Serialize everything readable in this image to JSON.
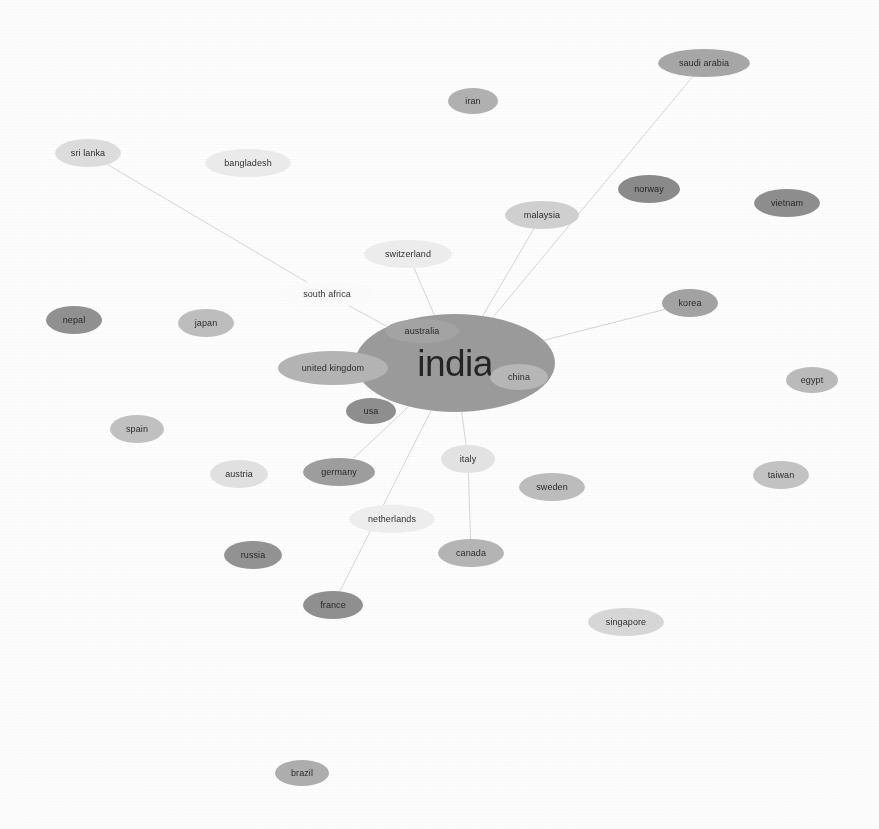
{
  "chart_data": {
    "type": "network-graph",
    "title": "",
    "subtitle": "",
    "xlabel": "",
    "ylabel": "",
    "legend": [],
    "annotations": [],
    "grid": false,
    "background_color": "#fdfdfd",
    "edge_color": "#c9c9c9",
    "node_palette": {
      "dark": "#8c8c8c",
      "medium": "#a8a8a8",
      "light": "#c9c9c9",
      "very_light": "#e4e4e4",
      "faint": "#f4f4f4",
      "hub": "#9a9a9a",
      "text": "#1b1b1b"
    },
    "canvas": {
      "width": 879,
      "height": 829
    },
    "nodes": [
      {
        "id": "india",
        "label": "india",
        "x": 455,
        "y": 363,
        "rx": 100,
        "ry": 49,
        "font_size": 37,
        "fill": "#9a9a9a",
        "shade": "hub"
      },
      {
        "id": "australia",
        "label": "australia",
        "x": 422,
        "y": 331,
        "rx": 37,
        "ry": 12,
        "font_size": 9,
        "fill": "#a3a3a3",
        "shade": "medium"
      },
      {
        "id": "china",
        "label": "china",
        "x": 519,
        "y": 377,
        "rx": 29,
        "ry": 13,
        "font_size": 9,
        "fill": "#b6b6b6",
        "shade": "light"
      },
      {
        "id": "united-kingdom",
        "label": "united kingdom",
        "x": 333,
        "y": 368,
        "rx": 55,
        "ry": 17,
        "font_size": 9,
        "fill": "#b3b3b3",
        "shade": "light"
      },
      {
        "id": "usa",
        "label": "usa",
        "x": 371,
        "y": 411,
        "rx": 25,
        "ry": 13,
        "font_size": 9,
        "fill": "#8e8e8e",
        "shade": "dark"
      },
      {
        "id": "south-africa",
        "label": "south africa",
        "x": 327,
        "y": 294,
        "rx": 47,
        "ry": 13,
        "font_size": 9,
        "fill": "#fafafa",
        "shade": "faint"
      },
      {
        "id": "switzerland",
        "label": "switzerland",
        "x": 408,
        "y": 254,
        "rx": 44,
        "ry": 14,
        "font_size": 9,
        "fill": "#ececec",
        "shade": "faint"
      },
      {
        "id": "japan",
        "label": "japan",
        "x": 206,
        "y": 323,
        "rx": 28,
        "ry": 14,
        "font_size": 9,
        "fill": "#bdbdbd",
        "shade": "light"
      },
      {
        "id": "nepal",
        "label": "nepal",
        "x": 74,
        "y": 320,
        "rx": 28,
        "ry": 14,
        "font_size": 9,
        "fill": "#909090",
        "shade": "dark"
      },
      {
        "id": "sri-lanka",
        "label": "sri lanka",
        "x": 88,
        "y": 153,
        "rx": 33,
        "ry": 14,
        "font_size": 9,
        "fill": "#dcdcdc",
        "shade": "very_light"
      },
      {
        "id": "bangladesh",
        "label": "bangladesh",
        "x": 248,
        "y": 163,
        "rx": 43,
        "ry": 14,
        "font_size": 9,
        "fill": "#eaeaea",
        "shade": "faint"
      },
      {
        "id": "iran",
        "label": "iran",
        "x": 473,
        "y": 101,
        "rx": 25,
        "ry": 13,
        "font_size": 9,
        "fill": "#b0b0b0",
        "shade": "light"
      },
      {
        "id": "saudi-arabia",
        "label": "saudi arabia",
        "x": 704,
        "y": 63,
        "rx": 46,
        "ry": 14,
        "font_size": 9,
        "fill": "#a6a6a6",
        "shade": "medium"
      },
      {
        "id": "norway",
        "label": "norway",
        "x": 649,
        "y": 189,
        "rx": 31,
        "ry": 14,
        "font_size": 9,
        "fill": "#8a8a8a",
        "shade": "dark"
      },
      {
        "id": "malaysia",
        "label": "malaysia",
        "x": 542,
        "y": 215,
        "rx": 37,
        "ry": 14,
        "font_size": 9,
        "fill": "#cfcfcf",
        "shade": "light"
      },
      {
        "id": "vietnam",
        "label": "vietnam",
        "x": 787,
        "y": 203,
        "rx": 33,
        "ry": 14,
        "font_size": 9,
        "fill": "#8d8d8d",
        "shade": "dark"
      },
      {
        "id": "korea",
        "label": "korea",
        "x": 690,
        "y": 303,
        "rx": 28,
        "ry": 14,
        "font_size": 9,
        "fill": "#a2a2a2",
        "shade": "medium"
      },
      {
        "id": "egypt",
        "label": "egypt",
        "x": 812,
        "y": 380,
        "rx": 26,
        "ry": 13,
        "font_size": 9,
        "fill": "#bababa",
        "shade": "light"
      },
      {
        "id": "taiwan",
        "label": "taiwan",
        "x": 781,
        "y": 475,
        "rx": 28,
        "ry": 14,
        "font_size": 9,
        "fill": "#c2c2c2",
        "shade": "light"
      },
      {
        "id": "spain",
        "label": "spain",
        "x": 137,
        "y": 429,
        "rx": 27,
        "ry": 14,
        "font_size": 9,
        "fill": "#c0c0c0",
        "shade": "light"
      },
      {
        "id": "austria",
        "label": "austria",
        "x": 239,
        "y": 474,
        "rx": 29,
        "ry": 14,
        "font_size": 9,
        "fill": "#e0e0e0",
        "shade": "very_light"
      },
      {
        "id": "germany",
        "label": "germany",
        "x": 339,
        "y": 472,
        "rx": 36,
        "ry": 14,
        "font_size": 9,
        "fill": "#9d9d9d",
        "shade": "medium"
      },
      {
        "id": "italy",
        "label": "italy",
        "x": 468,
        "y": 459,
        "rx": 27,
        "ry": 14,
        "font_size": 9,
        "fill": "#e2e2e2",
        "shade": "very_light"
      },
      {
        "id": "sweden",
        "label": "sweden",
        "x": 552,
        "y": 487,
        "rx": 33,
        "ry": 14,
        "font_size": 9,
        "fill": "#bcbcbc",
        "shade": "light"
      },
      {
        "id": "netherlands",
        "label": "netherlands",
        "x": 392,
        "y": 519,
        "rx": 43,
        "ry": 14,
        "font_size": 9,
        "fill": "#ededed",
        "shade": "faint"
      },
      {
        "id": "canada",
        "label": "canada",
        "x": 471,
        "y": 553,
        "rx": 33,
        "ry": 14,
        "font_size": 9,
        "fill": "#b4b4b4",
        "shade": "light"
      },
      {
        "id": "russia",
        "label": "russia",
        "x": 253,
        "y": 555,
        "rx": 29,
        "ry": 14,
        "font_size": 9,
        "fill": "#929292",
        "shade": "dark"
      },
      {
        "id": "france",
        "label": "france",
        "x": 333,
        "y": 605,
        "rx": 30,
        "ry": 14,
        "font_size": 9,
        "fill": "#8f8f8f",
        "shade": "dark"
      },
      {
        "id": "singapore",
        "label": "singapore",
        "x": 626,
        "y": 622,
        "rx": 38,
        "ry": 14,
        "font_size": 9,
        "fill": "#d6d6d6",
        "shade": "very_light"
      },
      {
        "id": "brazil",
        "label": "brazil",
        "x": 302,
        "y": 773,
        "rx": 27,
        "ry": 13,
        "font_size": 9,
        "fill": "#adadad",
        "shade": "medium"
      }
    ],
    "edges": [
      {
        "source": "india",
        "target": "saudi-arabia"
      },
      {
        "source": "india",
        "target": "malaysia"
      },
      {
        "source": "india",
        "target": "korea"
      },
      {
        "source": "india",
        "target": "italy"
      },
      {
        "source": "italy",
        "target": "canada"
      },
      {
        "source": "india",
        "target": "germany"
      },
      {
        "source": "india",
        "target": "usa"
      },
      {
        "source": "india",
        "target": "france"
      },
      {
        "source": "india",
        "target": "south-africa"
      },
      {
        "source": "south-africa",
        "target": "sri-lanka"
      },
      {
        "source": "india",
        "target": "switzerland"
      },
      {
        "source": "india",
        "target": "united-kingdom"
      },
      {
        "source": "india",
        "target": "china"
      },
      {
        "source": "india",
        "target": "australia"
      }
    ]
  }
}
